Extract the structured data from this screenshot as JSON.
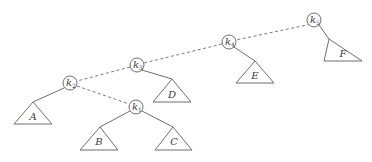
{
  "diagram": {
    "type": "binary-tree",
    "nodes": [
      {
        "id": "k1",
        "base": "k",
        "sub": "1",
        "x": 136,
        "y": 107
      },
      {
        "id": "k2",
        "base": "k",
        "sub": "2",
        "x": 70,
        "y": 83
      },
      {
        "id": "k3",
        "base": "k",
        "sub": "3",
        "x": 137,
        "y": 65
      },
      {
        "id": "k4",
        "base": "k",
        "sub": "4",
        "x": 229,
        "y": 42
      },
      {
        "id": "k5",
        "base": "k",
        "sub": "5",
        "x": 314,
        "y": 20
      }
    ],
    "subtrees": [
      {
        "id": "A",
        "label": "A",
        "parent": "k2"
      },
      {
        "id": "B",
        "label": "B",
        "parent": "k1"
      },
      {
        "id": "C",
        "label": "C",
        "parent": "k1"
      },
      {
        "id": "D",
        "label": "D",
        "parent": "k3"
      },
      {
        "id": "E",
        "label": "E",
        "parent": "k4"
      },
      {
        "id": "F",
        "label": "F",
        "parent": "k5"
      }
    ],
    "dashed_path": [
      "k1",
      "k2",
      "k3",
      "k4",
      "k5"
    ]
  }
}
